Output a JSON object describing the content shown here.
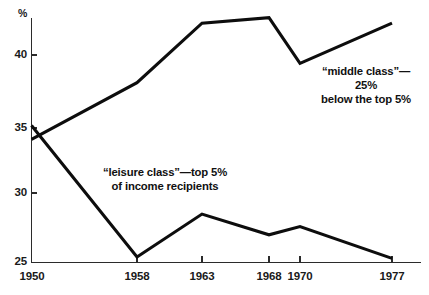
{
  "chart_data": {
    "type": "line",
    "title": "",
    "xlabel": "",
    "ylabel": "%",
    "x": [
      1950,
      1958,
      1963,
      1968,
      1970,
      1977
    ],
    "xticklabels": [
      "1950",
      "1958",
      "1963",
      "1968",
      "1970",
      "1977"
    ],
    "yticks": [
      25,
      30,
      35,
      40
    ],
    "yticklabels": [
      "25",
      "30",
      "35",
      "40"
    ],
    "ylim": [
      25,
      43.5
    ],
    "xlim": [
      1950,
      1977
    ],
    "grid": false,
    "legend_position": "inline-annotations",
    "series": [
      {
        "name": "middle class",
        "values": [
          33.9,
          38.0,
          42.3,
          42.7,
          39.4,
          42.3
        ]
      },
      {
        "name": "leisure class",
        "values": [
          34.9,
          25.4,
          28.5,
          27.0,
          27.6,
          25.3
        ]
      }
    ],
    "annotations": [
      {
        "id": "middle-class",
        "text": "“middle class”—25%\nbelow the top 5%"
      },
      {
        "id": "leisure-class",
        "text": "“leisure class”—top 5%\nof income recipients"
      }
    ]
  },
  "axes": {
    "unit_label": "%",
    "y_labels": [
      "40",
      "35",
      "30",
      "25"
    ],
    "x_labels": [
      "1950",
      "1958",
      "1963",
      "1968",
      "1970",
      "1977"
    ]
  },
  "colors": {
    "line": "#0d0d0d",
    "axis": "#2b2b2b",
    "text": "#111111",
    "background": "#ffffff"
  }
}
